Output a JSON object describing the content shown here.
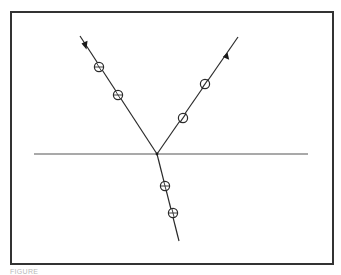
{
  "figure": {
    "frame": {
      "x1": 11,
      "y1": 12,
      "x2": 333,
      "y2": 264
    },
    "baseline": {
      "x1": 34,
      "y1": 154,
      "x2": 308,
      "y2": 154
    },
    "vertex": {
      "x": 157,
      "y": 154
    },
    "tracks": [
      {
        "name": "left-track",
        "start": {
          "x": 80,
          "y": 36
        },
        "end": {
          "x": 157,
          "y": 154
        },
        "arrow": {
          "x": 85,
          "y": 47,
          "direction": "toward-vertex"
        },
        "markers": [
          {
            "x": 99,
            "y": 67,
            "style": "crosshair"
          },
          {
            "x": 118,
            "y": 95,
            "style": "crosshair"
          }
        ]
      },
      {
        "name": "right-track",
        "start": {
          "x": 157,
          "y": 154
        },
        "end": {
          "x": 238,
          "y": 37
        },
        "arrow": {
          "x": 226,
          "y": 55,
          "direction": "away-from-vertex"
        },
        "markers": [
          {
            "x": 183,
            "y": 118,
            "style": "slash"
          },
          {
            "x": 205,
            "y": 84,
            "style": "slash"
          }
        ]
      },
      {
        "name": "bottom-track",
        "start": {
          "x": 157,
          "y": 154
        },
        "end": {
          "x": 179,
          "y": 241
        },
        "arrow": null,
        "markers": [
          {
            "x": 165,
            "y": 186,
            "style": "crosshair"
          },
          {
            "x": 173,
            "y": 213,
            "style": "crosshair"
          }
        ]
      }
    ],
    "colors": {
      "line": "#2a2a2a",
      "frame": "#333333",
      "background": "#ffffff"
    }
  },
  "caption": {
    "text": "FIGURE"
  }
}
